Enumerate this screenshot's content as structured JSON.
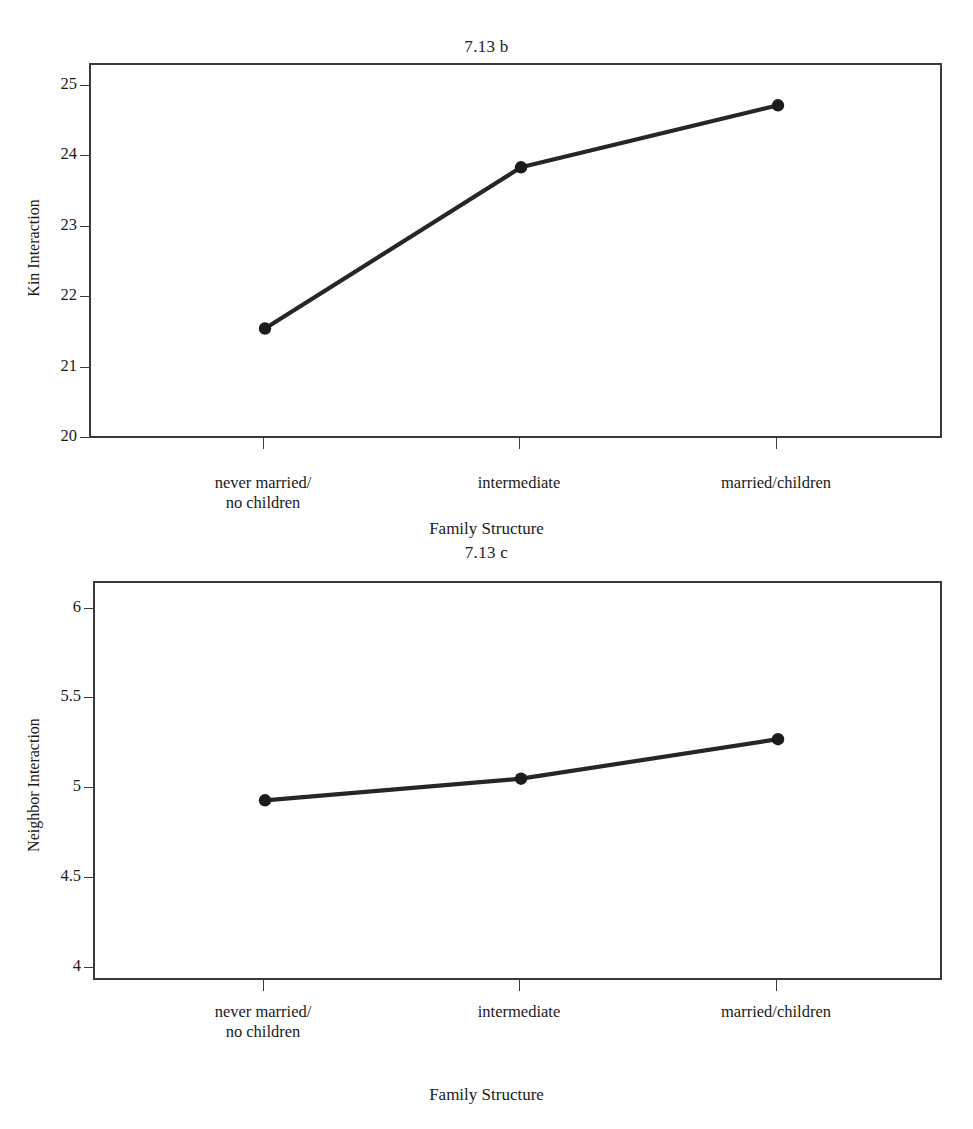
{
  "figure": {
    "background": "#ffffff",
    "line_color": "#262626",
    "marker_color": "#1c1c1c",
    "frame_color": "#3a3a3a"
  },
  "chart_data": [
    {
      "id": "chart-b",
      "type": "line",
      "title": "7.13 b",
      "xlabel": "Family Structure",
      "ylabel": "Kin Interaction",
      "categories": [
        "never married/\nno children",
        "intermediate",
        "married/children"
      ],
      "category_lines": [
        [
          "never married/",
          "no children"
        ],
        [
          "intermediate",
          ""
        ],
        [
          "married/children",
          ""
        ]
      ],
      "values": [
        21.57,
        23.86,
        24.74
      ],
      "ytick_labels": [
        "25",
        "24",
        "23",
        "22",
        "21",
        "20"
      ],
      "ytick_values": [
        25,
        24,
        23,
        22,
        21,
        20
      ],
      "ylim": [
        19.75,
        25.28
      ],
      "grid": false,
      "legend": "none",
      "markers": "filled-circle"
    },
    {
      "id": "chart-c",
      "type": "line",
      "title": "7.13 c",
      "xlabel": "Family Structure",
      "ylabel": "Neighbor Interaction",
      "categories": [
        "never married/\nno children",
        "intermediate",
        "married/children"
      ],
      "category_lines": [
        [
          "never married/",
          "no children"
        ],
        [
          "intermediate",
          ""
        ],
        [
          "married/children",
          ""
        ]
      ],
      "values": [
        4.94,
        5.06,
        5.28
      ],
      "ytick_labels": [
        "6",
        "5.5",
        "5",
        "4.5",
        "4"
      ],
      "ytick_values": [
        6,
        5.5,
        5,
        4.5,
        4
      ],
      "ylim": [
        3.9,
        6.15
      ],
      "grid": false,
      "legend": "none",
      "markers": "filled-circle"
    }
  ]
}
